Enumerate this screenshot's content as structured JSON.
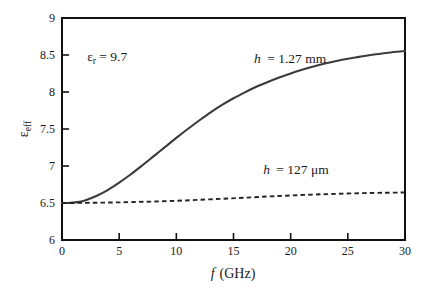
{
  "chart_data": {
    "type": "line",
    "title": "",
    "xlabel": "f (GHz)",
    "xlabel_symbol": "f",
    "xlabel_unit": "(GHz)",
    "ylabel": "ε_eff",
    "ylabel_symbol": "ε",
    "ylabel_subscript": "eff",
    "xlim": [
      0,
      30
    ],
    "ylim": [
      6,
      9
    ],
    "xticks": [
      0,
      5,
      10,
      15,
      20,
      25,
      30
    ],
    "xtick_labels": [
      "0",
      "5",
      "10",
      "15",
      "20",
      "25",
      "30"
    ],
    "yticks": [
      6,
      6.5,
      7,
      7.5,
      8,
      8.5,
      9
    ],
    "ytick_labels": [
      "6",
      "6.5",
      "7",
      "7.5",
      "8",
      "8.5",
      "9"
    ],
    "grid": false,
    "legend_position": "inline-annotations",
    "annotations": [
      {
        "name": "substrate-permittivity",
        "symbol": "ε",
        "subscript": "r",
        "text": " = 9.7",
        "full_text": "εr = 9.7",
        "x_data": 2.2,
        "y_data": 8.42
      },
      {
        "name": "curve-label-thick-substrate",
        "symbol": "h",
        "subscript": "",
        "text": " = 1.27 mm",
        "full_text": "h = 1.27 mm",
        "x_data": 16.8,
        "y_data": 8.39
      },
      {
        "name": "curve-label-thin-substrate",
        "symbol": "h",
        "subscript": "",
        "text": " = 127 μm",
        "full_text": "h = 127 μm",
        "x_data": 17.6,
        "y_data": 6.89
      }
    ],
    "series": [
      {
        "name": "h = 1.27 mm",
        "style": "solid",
        "color": "#3b3b3b",
        "x": [
          0,
          0.5,
          1,
          1.5,
          2,
          3,
          4,
          5,
          6,
          7,
          8,
          9,
          10,
          11,
          12,
          13,
          14,
          15,
          16,
          17,
          18,
          19,
          20,
          21,
          22,
          23,
          24,
          25,
          26,
          27,
          28,
          29,
          30
        ],
        "y": [
          6.5,
          6.5,
          6.505,
          6.515,
          6.535,
          6.595,
          6.675,
          6.775,
          6.885,
          7.005,
          7.13,
          7.255,
          7.38,
          7.5,
          7.615,
          7.725,
          7.825,
          7.915,
          7.995,
          8.07,
          8.135,
          8.195,
          8.25,
          8.3,
          8.345,
          8.385,
          8.42,
          8.45,
          8.475,
          8.5,
          8.52,
          8.54,
          8.555
        ]
      },
      {
        "name": "h = 127 μm",
        "style": "dashed",
        "color": "#222222",
        "x": [
          0,
          2,
          4,
          6,
          8,
          10,
          12,
          14,
          16,
          18,
          20,
          22,
          24,
          26,
          28,
          30
        ],
        "y": [
          6.5,
          6.502,
          6.506,
          6.512,
          6.52,
          6.53,
          6.543,
          6.557,
          6.572,
          6.588,
          6.602,
          6.614,
          6.624,
          6.632,
          6.638,
          6.642
        ]
      }
    ]
  }
}
